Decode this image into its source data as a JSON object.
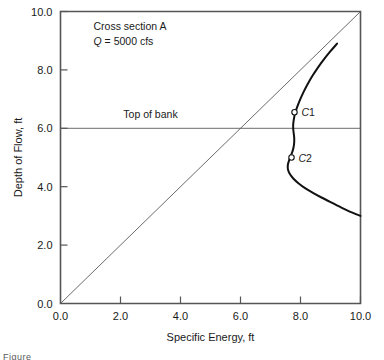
{
  "figure": {
    "background_color": "#ffffff",
    "frame_color": "#555555",
    "curve_color": "#111111",
    "line_color": "#5a5a5a",
    "caption_fragment": "Figure"
  },
  "chart_data": {
    "type": "line",
    "title": "",
    "xlabel": "Specific Energy, ft",
    "ylabel": "Depth of Flow, ft",
    "xlim": [
      0.0,
      10.0
    ],
    "ylim": [
      0.0,
      10.0
    ],
    "xticks": [
      "0.0",
      "2.0",
      "4.0",
      "6.0",
      "8.0",
      "10.0"
    ],
    "xtick_values": [
      0.0,
      2.0,
      4.0,
      6.0,
      8.0,
      10.0
    ],
    "yticks": [
      "0.0",
      "2.0",
      "4.0",
      "6.0",
      "8.0",
      "10.0"
    ],
    "ytick_values": [
      0.0,
      2.0,
      4.0,
      6.0,
      8.0,
      10.0
    ],
    "grid": false,
    "legend": null,
    "annotations": [
      {
        "name": "cross-section",
        "text": "Cross section A",
        "x": 1.1,
        "y": 9.35,
        "italic_prefix": ""
      },
      {
        "name": "discharge",
        "text": "= 5000 cfs",
        "italic_symbol": "Q",
        "x": 1.1,
        "y": 8.85
      },
      {
        "name": "top-of-bank",
        "text": "Top of bank",
        "x": 3.0,
        "y": 6.35
      }
    ],
    "series": [
      {
        "name": "specific-energy-curve",
        "style": "solid",
        "width": 2.0,
        "points": [
          [
            9.22,
            8.9
          ],
          [
            9.0,
            8.64
          ],
          [
            8.78,
            8.36
          ],
          [
            8.58,
            8.08
          ],
          [
            8.4,
            7.8
          ],
          [
            8.24,
            7.52
          ],
          [
            8.1,
            7.24
          ],
          [
            7.99,
            6.99
          ],
          [
            7.9,
            6.76
          ],
          [
            7.83,
            6.56
          ],
          [
            7.79,
            6.38
          ],
          [
            7.765,
            6.22
          ],
          [
            7.755,
            6.08
          ],
          [
            7.76,
            5.95
          ],
          [
            7.775,
            5.82
          ],
          [
            7.79,
            5.68
          ],
          [
            7.79,
            5.52
          ],
          [
            7.77,
            5.36
          ],
          [
            7.73,
            5.2
          ],
          [
            7.67,
            5.04
          ],
          [
            7.62,
            4.9
          ],
          [
            7.58,
            4.76
          ],
          [
            7.58,
            4.6
          ],
          [
            7.64,
            4.44
          ],
          [
            7.76,
            4.28
          ],
          [
            7.93,
            4.12
          ],
          [
            8.14,
            3.96
          ],
          [
            8.4,
            3.8
          ],
          [
            8.7,
            3.63
          ],
          [
            9.02,
            3.46
          ],
          [
            9.35,
            3.29
          ],
          [
            9.66,
            3.14
          ],
          [
            10.0,
            3.0
          ]
        ]
      },
      {
        "name": "45-degree-reference-line",
        "style": "solid",
        "width": 0.9,
        "points": [
          [
            0.0,
            0.0
          ],
          [
            10.0,
            10.0
          ]
        ]
      },
      {
        "name": "top-of-bank-line",
        "style": "solid",
        "width": 0.9,
        "points": [
          [
            0.0,
            6.0
          ],
          [
            10.0,
            6.0
          ]
        ]
      }
    ],
    "markers": [
      {
        "label": "C1",
        "italic_letter": "C",
        "number": "1",
        "x": 7.8,
        "y": 6.55,
        "marker": "open-circle"
      },
      {
        "label": "C2",
        "italic_letter": "C",
        "number": "2",
        "x": 7.7,
        "y": 5.0,
        "marker": "open-circle"
      }
    ]
  }
}
